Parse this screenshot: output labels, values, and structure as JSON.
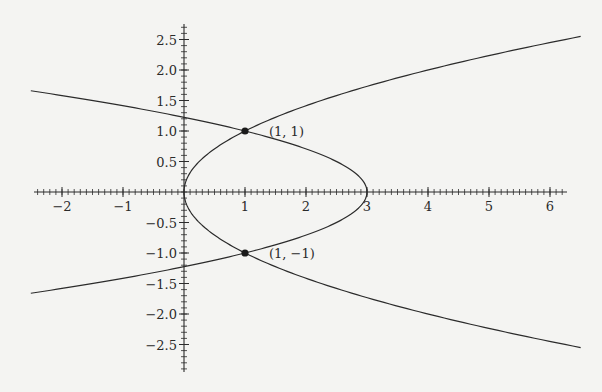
{
  "chart_data": {
    "type": "line",
    "title": "",
    "xlabel": "",
    "ylabel": "",
    "xlim": [
      -2.5,
      6.5
    ],
    "ylim": [
      -2.9,
      2.7
    ],
    "grid": false,
    "legend": null,
    "x_ticks": [
      -2,
      -1,
      1,
      2,
      3,
      4,
      5,
      6
    ],
    "x_tick_labels": [
      "−2",
      "−1",
      "1",
      "2",
      "3",
      "4",
      "5",
      "6"
    ],
    "y_ticks": [
      2.5,
      2.0,
      1.5,
      1.0,
      0.5,
      -0.5,
      -1.0,
      -1.5,
      -2.0,
      -2.5
    ],
    "y_tick_labels": [
      "2.5",
      "2.0",
      "1.5",
      "1.0",
      "0.5",
      "−0.5",
      "−1.0",
      "−1.5",
      "−2.0",
      "−2.5"
    ],
    "minor_tick_step": 0.1,
    "series": [
      {
        "name": "x = y^2",
        "equation": "x = y^2",
        "y_range": [
          -2.55,
          2.55
        ],
        "color": "#2b2b2b"
      },
      {
        "name": "x = 3 - 2y^2",
        "equation": "x = 3 - 2y^2",
        "y_range": [
          -1.66,
          1.66
        ],
        "color": "#2b2b2b"
      }
    ],
    "points": [
      {
        "x": 1,
        "y": 1,
        "label": "(1, 1)"
      },
      {
        "x": 1,
        "y": -1,
        "label": "(1, −1)"
      }
    ]
  },
  "layout": {
    "origin_px": [
      184,
      192
    ],
    "unit_px": 61,
    "axis_x_px": [
      34,
      567
    ],
    "axis_y_px": [
      24,
      372
    ]
  }
}
